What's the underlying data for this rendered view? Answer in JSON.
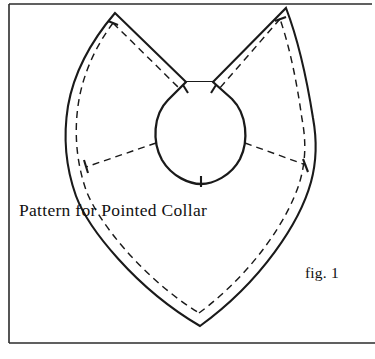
{
  "figure": {
    "caption": "Pattern for Pointed Collar",
    "figure_label": "fig. 1",
    "ink_color": "#1a1a1a",
    "paper_color": "#ffffff",
    "frame_color": "#2b2b2b",
    "parts": {
      "outline_name": "collar-outer-outline",
      "neck_name": "neck-opening",
      "stitch_name": "stitching-dashed-line",
      "fold_name": "fold-dashed-line",
      "notch_name": "center-back-notch"
    }
  },
  "diagram_geometry": {
    "frame": {
      "x": 9,
      "y": 4,
      "width": 358,
      "height": 339
    },
    "left_peak": [
      115,
      13
    ],
    "right_peak": [
      286,
      8
    ],
    "left_gap_corner": [
      186,
      82
    ],
    "right_gap_corner": [
      213,
      82
    ],
    "bottom_point": [
      200,
      326
    ],
    "neck_center": [
      200,
      130
    ],
    "neck_radius": 45,
    "left_widest_x": 68,
    "right_widest_x": 315
  }
}
